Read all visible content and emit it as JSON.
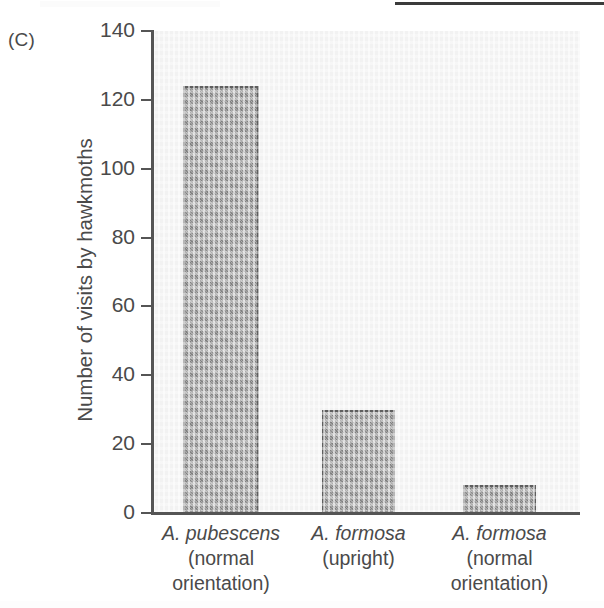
{
  "figure": {
    "panel_label": "(C)"
  },
  "chart_data": {
    "type": "bar",
    "title": "",
    "xlabel": "",
    "ylabel": "Number of visits by hawkmoths",
    "ylim": [
      0,
      140
    ],
    "ytick_step": 20,
    "ytick_labels": [
      "140",
      "120",
      "100",
      "80",
      "60",
      "40",
      "20",
      "0"
    ],
    "ytick_values": [
      140,
      120,
      100,
      80,
      60,
      40,
      20,
      0
    ],
    "grid": false,
    "legend": "none",
    "bar_color": "#8e8e8e",
    "bar_edge_color": "#5e5e5e",
    "plot_background": "#f2f2f2",
    "categories": [
      "A. pubescens (normal orientation)",
      "A. formosa (upright)",
      "A. formosa (normal orientation)"
    ],
    "category_lines": [
      [
        "A. pubescens",
        "(normal",
        "orientation)"
      ],
      [
        "A. formosa",
        "(upright)"
      ],
      [
        "A. formosa",
        "(normal",
        "orientation)"
      ]
    ],
    "values": [
      124,
      30,
      8
    ]
  }
}
